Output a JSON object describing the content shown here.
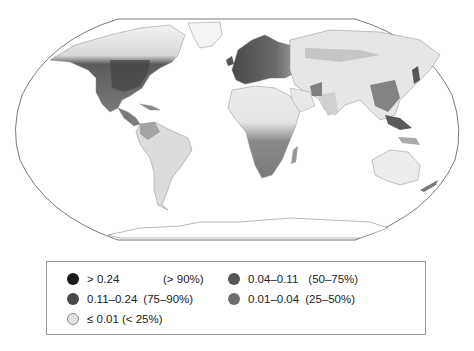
{
  "map": {
    "projection": "Robinson",
    "colors": {
      "outline": "#6a6a6a",
      "ocean": "#ffffff",
      "land_low": "#ececec",
      "land_mid": "#bdbdbd",
      "land_high": "#6e6e6e",
      "land_very_high": "#3a3a3a",
      "border": "#8a8a8a"
    }
  },
  "legend": {
    "items": [
      {
        "range": "> 0.24",
        "percent": "(> 90%)",
        "color": "#1a1a1a"
      },
      {
        "range": "0.11–0.24",
        "percent": "(75–90%)",
        "color": "#4a4a4a"
      },
      {
        "range": "≤ 0.01",
        "percent": "(< 25%)",
        "color": "#e2e2e2"
      },
      {
        "range": "0.04–0.11",
        "percent": "(50–75%)",
        "color": "#555555"
      },
      {
        "range": "0.01–0.04",
        "percent": "(25–50%)",
        "color": "#6e6e6e"
      }
    ]
  }
}
